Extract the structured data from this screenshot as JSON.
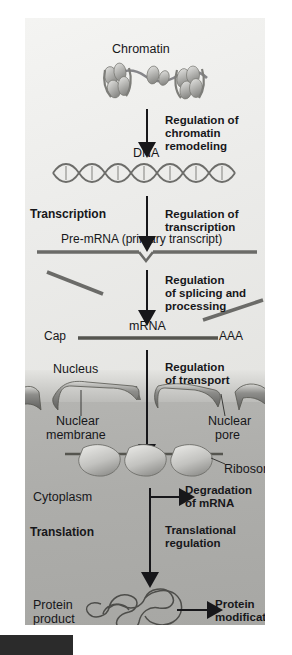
{
  "figure": {
    "title_stage_1": "Chromatin",
    "stage_dna": "DNA",
    "stage_premrna": "Pre-mRNA (primary transcript)",
    "stage_mrna": "mRNA",
    "cap_label": "Cap",
    "polyA_label": "AAA",
    "transcription": "Transcription",
    "translation": "Translation",
    "nucleus": "Nucleus",
    "nuclear_membrane": "Nuclear\nmembrane",
    "nuclear_membrane_l1": "Nuclear",
    "nuclear_membrane_l2": "membrane",
    "nuclear_pore_l1": "Nuclear",
    "nuclear_pore_l2": "pore",
    "ribosome": "Ribosome",
    "cytoplasm": "Cytoplasm",
    "protein_product_l1": "Protein",
    "protein_product_l2": "product"
  },
  "regulation": {
    "chromatin_l1": "Regulation of",
    "chromatin_l2": "chromatin",
    "chromatin_l3": "remodeling",
    "transcription_l1": "Regulation of",
    "transcription_l2": "transcription",
    "splicing_l1": "Regulation",
    "splicing_l2": "of splicing and",
    "splicing_l3": "processing",
    "transport_l1": "Regulation",
    "transport_l2": "of transport",
    "degradation_l1": "Degradation",
    "degradation_l2": "of mRNA",
    "translational_l1": "Translational",
    "translational_l2": "regulation",
    "protein_mod_l1": "Protein",
    "protein_mod_l2": "modifications"
  },
  "colors": {
    "ink": "#17171a",
    "nucleus_bg": "#ececea",
    "cytoplasm_bg": "#adadaa",
    "structure": "#6e6e6c",
    "bar": "#2b2b2b"
  }
}
